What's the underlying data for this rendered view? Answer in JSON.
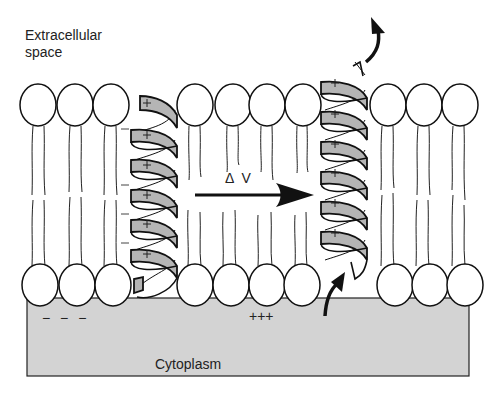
{
  "diagram": {
    "labels": {
      "extracellular": "Extracellular space",
      "extracellular_line1": "Extracellular",
      "extracellular_line2": "space",
      "cytoplasm": "Cytoplasm",
      "delta_v": "Δ V",
      "cytoplasm_negative_charges": "− − −",
      "cytoplasm_positive_charges": "+++"
    },
    "helices": [
      {
        "name": "resting-helix",
        "position": "left",
        "charge_count": 6,
        "charge_symbol": "+"
      },
      {
        "name": "activated-helix",
        "position": "right",
        "charge_count": 6,
        "charge_symbol": "+"
      }
    ],
    "membrane_side_charges": {
      "symbol": "−",
      "count": 4
    },
    "arrows": [
      {
        "name": "delta-v-arrow",
        "direction": "right",
        "label": "Δ V"
      },
      {
        "name": "outward-curved-arrow",
        "direction": "up"
      },
      {
        "name": "inward-curved-arrow",
        "direction": "up"
      }
    ],
    "colors": {
      "helix_fill": "#b5b5b5",
      "cytoplasm_fill": "#d3d3d3",
      "stroke": "#111111",
      "background": "#ffffff"
    }
  }
}
